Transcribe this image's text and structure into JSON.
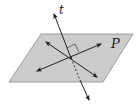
{
  "diagram": {
    "labels": {
      "line": "t",
      "plane": "P"
    },
    "colors": {
      "plane_fill": "#cccccc",
      "plane_stroke": "#8a8a8a",
      "line": "#222222",
      "background": "#ffffff"
    },
    "plane": {
      "vertices": [
        [
          41,
          34
        ],
        [
          133,
          34
        ],
        [
          103,
          82
        ],
        [
          9,
          82
        ]
      ]
    },
    "line_t": {
      "start": [
        54,
        14
      ],
      "end": [
        89,
        100
      ],
      "intersection": [
        71,
        58
      ]
    },
    "plane_line_1": {
      "start": [
        46,
        42
      ],
      "end": [
        97,
        77
      ]
    },
    "plane_line_2": {
      "start": [
        37,
        71
      ],
      "end": [
        101,
        44
      ]
    },
    "right_angle_marker": true
  }
}
